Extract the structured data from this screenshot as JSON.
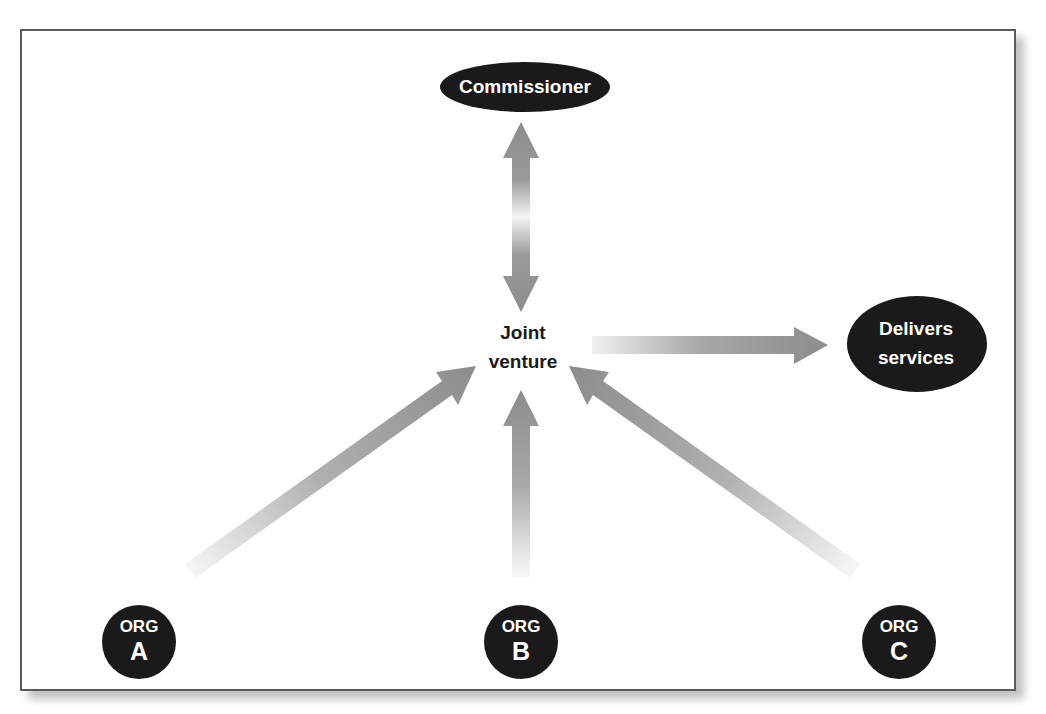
{
  "diagram": {
    "type": "joint-venture-structure",
    "colors": {
      "node_fill": "#1a1a1a",
      "node_text": "#ffffff",
      "arrow": "#8c8c8c",
      "frame_border": "#5a5a5a",
      "center_text": "#1a1a1a"
    },
    "nodes": {
      "commissioner": {
        "label": "Commissioner"
      },
      "joint_venture": {
        "line1": "Joint",
        "line2": "venture"
      },
      "delivers_services": {
        "line1": "Delivers",
        "line2": "services"
      },
      "org_a": {
        "line1": "ORG",
        "line2": "A"
      },
      "org_b": {
        "line1": "ORG",
        "line2": "B"
      },
      "org_c": {
        "line1": "ORG",
        "line2": "C"
      }
    },
    "edges": [
      {
        "from": "joint_venture",
        "to": "commissioner",
        "bidirectional": true
      },
      {
        "from": "joint_venture",
        "to": "delivers_services",
        "bidirectional": false
      },
      {
        "from": "org_a",
        "to": "joint_venture",
        "bidirectional": false
      },
      {
        "from": "org_b",
        "to": "joint_venture",
        "bidirectional": false
      },
      {
        "from": "org_c",
        "to": "joint_venture",
        "bidirectional": false
      }
    ]
  }
}
